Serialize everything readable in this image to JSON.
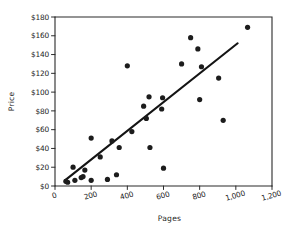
{
  "chart_data": {
    "type": "scatter",
    "title": "",
    "xlabel": "Pages",
    "ylabel": "Price",
    "xlim": [
      0,
      1200
    ],
    "ylim": [
      0,
      180
    ],
    "grid": false,
    "legend": null,
    "x_ticks": [
      0,
      200,
      400,
      600,
      800,
      1000,
      1200
    ],
    "x_tick_labels": [
      "0",
      "200",
      "400",
      "600",
      "800",
      "1,000",
      "1,200"
    ],
    "y_ticks": [
      0,
      20,
      40,
      60,
      80,
      100,
      120,
      140,
      160,
      180
    ],
    "y_tick_labels": [
      "$0",
      "$20",
      "$40",
      "$60",
      "$80",
      "$100",
      "$120",
      "$140",
      "$160",
      "$180"
    ],
    "points": [
      {
        "x": 60,
        "y": 5
      },
      {
        "x": 70,
        "y": 4
      },
      {
        "x": 100,
        "y": 20
      },
      {
        "x": 110,
        "y": 6
      },
      {
        "x": 145,
        "y": 9
      },
      {
        "x": 155,
        "y": 10
      },
      {
        "x": 165,
        "y": 17
      },
      {
        "x": 200,
        "y": 51
      },
      {
        "x": 200,
        "y": 6
      },
      {
        "x": 250,
        "y": 31
      },
      {
        "x": 290,
        "y": 7
      },
      {
        "x": 315,
        "y": 48
      },
      {
        "x": 340,
        "y": 12
      },
      {
        "x": 355,
        "y": 41
      },
      {
        "x": 400,
        "y": 128
      },
      {
        "x": 425,
        "y": 58
      },
      {
        "x": 490,
        "y": 85
      },
      {
        "x": 505,
        "y": 72
      },
      {
        "x": 520,
        "y": 95
      },
      {
        "x": 525,
        "y": 41
      },
      {
        "x": 590,
        "y": 82
      },
      {
        "x": 595,
        "y": 94
      },
      {
        "x": 600,
        "y": 19
      },
      {
        "x": 700,
        "y": 130
      },
      {
        "x": 750,
        "y": 158
      },
      {
        "x": 790,
        "y": 146
      },
      {
        "x": 800,
        "y": 92
      },
      {
        "x": 810,
        "y": 127
      },
      {
        "x": 905,
        "y": 115
      },
      {
        "x": 930,
        "y": 70
      },
      {
        "x": 1065,
        "y": 169
      }
    ],
    "trend_line": {
      "name": "least-squares fit",
      "x_start": 55,
      "y_start": 6,
      "x_end": 1010,
      "y_end": 152
    }
  }
}
